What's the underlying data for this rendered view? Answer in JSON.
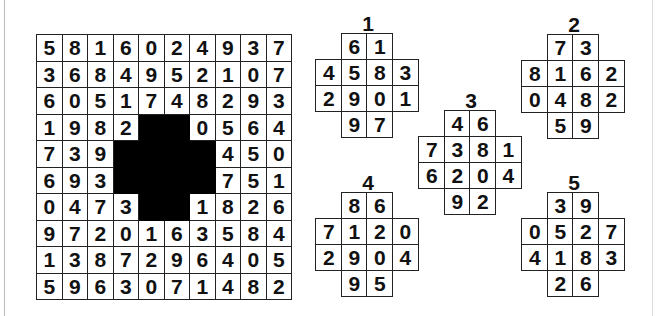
{
  "puzzle": {
    "grid": [
      [
        "5",
        "8",
        "1",
        "6",
        "0",
        "2",
        "4",
        "9",
        "3",
        "7"
      ],
      [
        "3",
        "6",
        "8",
        "4",
        "9",
        "5",
        "2",
        "1",
        "0",
        "7"
      ],
      [
        "6",
        "0",
        "5",
        "1",
        "7",
        "4",
        "8",
        "2",
        "9",
        "3"
      ],
      [
        "1",
        "9",
        "8",
        "2",
        "",
        "",
        "",
        "0",
        "5",
        "6",
        "4"
      ],
      [
        "7",
        "3",
        "9",
        "",
        "",
        "",
        "",
        "4",
        "5",
        "0"
      ],
      [
        "6",
        "9",
        "3",
        "",
        "",
        "",
        "",
        "7",
        "5",
        "1"
      ],
      [
        "0",
        "4",
        "7",
        "3",
        "",
        "",
        "1",
        "8",
        "2",
        "6"
      ],
      [
        "9",
        "7",
        "2",
        "0",
        "1",
        "6",
        "3",
        "5",
        "8",
        "4"
      ],
      [
        "1",
        "3",
        "8",
        "7",
        "2",
        "9",
        "6",
        "4",
        "0",
        "5"
      ],
      [
        "5",
        "9",
        "6",
        "3",
        "0",
        "7",
        "1",
        "4",
        "8",
        "2"
      ]
    ],
    "grid_rows": [
      {
        "cells": [
          "5",
          "8",
          "1",
          "6",
          "0",
          "2",
          "4",
          "9",
          "3",
          "7"
        ],
        "black": []
      },
      {
        "cells": [
          "3",
          "6",
          "8",
          "4",
          "9",
          "5",
          "2",
          "1",
          "0",
          "7"
        ],
        "black": []
      },
      {
        "cells": [
          "6",
          "0",
          "5",
          "1",
          "7",
          "4",
          "8",
          "2",
          "9",
          "3"
        ],
        "black": []
      },
      {
        "cells": [
          "1",
          "9",
          "8",
          "2",
          "",
          "",
          "0",
          "5",
          "6",
          "4"
        ],
        "black": [
          4,
          5
        ]
      },
      {
        "cells": [
          "7",
          "3",
          "9",
          "",
          "",
          "",
          "",
          "4",
          "5",
          "0"
        ],
        "black": [
          3,
          4,
          5,
          6
        ]
      },
      {
        "cells": [
          "6",
          "9",
          "3",
          "",
          "",
          "",
          "",
          "7",
          "5",
          "1"
        ],
        "black": [
          3,
          4,
          5,
          6
        ]
      },
      {
        "cells": [
          "0",
          "4",
          "7",
          "3",
          "",
          "",
          "1",
          "8",
          "2",
          "6"
        ],
        "black": [
          4,
          5
        ]
      },
      {
        "cells": [
          "9",
          "7",
          "2",
          "0",
          "1",
          "6",
          "3",
          "5",
          "8",
          "4"
        ],
        "black": []
      },
      {
        "cells": [
          "1",
          "3",
          "8",
          "7",
          "2",
          "9",
          "6",
          "4",
          "0",
          "5"
        ],
        "black": []
      },
      {
        "cells": [
          "5",
          "9",
          "6",
          "3",
          "0",
          "7",
          "1",
          "4",
          "8",
          "2"
        ],
        "black": []
      }
    ],
    "pieces": [
      {
        "label": "1",
        "rows": [
          [
            "6",
            "1"
          ],
          [
            "4",
            "5",
            "8",
            "3"
          ],
          [
            "2",
            "9",
            "0",
            "1"
          ],
          [
            "9",
            "7"
          ]
        ]
      },
      {
        "label": "2",
        "rows": [
          [
            "7",
            "3"
          ],
          [
            "8",
            "1",
            "6",
            "2"
          ],
          [
            "0",
            "4",
            "8",
            "2"
          ],
          [
            "5",
            "9"
          ]
        ]
      },
      {
        "label": "3",
        "rows": [
          [
            "4",
            "6"
          ],
          [
            "7",
            "3",
            "8",
            "1"
          ],
          [
            "6",
            "2",
            "0",
            "4"
          ],
          [
            "9",
            "2"
          ]
        ]
      },
      {
        "label": "4",
        "rows": [
          [
            "8",
            "6"
          ],
          [
            "7",
            "1",
            "2",
            "0"
          ],
          [
            "2",
            "9",
            "0",
            "4"
          ],
          " "
        ],
        "rows_fixed": [
          [
            "8",
            "6"
          ],
          [
            "7",
            "1",
            "2",
            "0"
          ],
          [
            "2",
            "9",
            "0",
            "4"
          ],
          [
            "9",
            "5"
          ]
        ]
      },
      {
        "label": "5",
        "rows": [
          [
            "3",
            "9"
          ],
          [
            "0",
            "5",
            "2",
            "7"
          ],
          [
            "4",
            "1",
            "8",
            "3"
          ],
          [
            "2",
            "6"
          ]
        ]
      }
    ]
  }
}
